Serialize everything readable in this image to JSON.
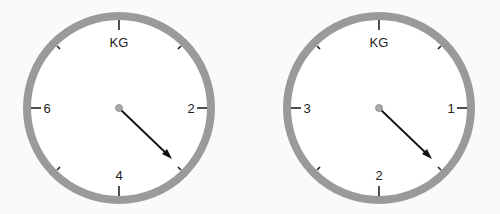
{
  "colors": {
    "ring": "#9a9a9a",
    "face": "#ffffff",
    "needle": "#111111",
    "hub": "#a8a8a8",
    "ticks": "#222222"
  },
  "dials": [
    {
      "unit": "KG",
      "labels": {
        "top": "KG",
        "right": "2",
        "bottom": "4",
        "left": "6"
      },
      "scale_max": 8,
      "needle_angle_deg": 135,
      "reading": 3
    },
    {
      "unit": "KG",
      "labels": {
        "top": "KG",
        "right": "1",
        "bottom": "2",
        "left": "3"
      },
      "scale_max": 4,
      "needle_angle_deg": 135,
      "reading": 1.5
    }
  ]
}
